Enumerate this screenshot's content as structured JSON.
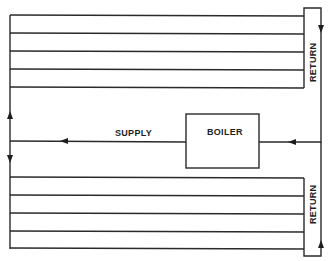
{
  "diagram": {
    "type": "two-pipe hot water heating loop (reverse return)",
    "labels": {
      "supply": "SUPPLY",
      "boiler": "BOILER",
      "return_upper": "RETURN",
      "return_lower": "RETURN"
    },
    "upper_circuit": {
      "branch_count": 5,
      "flow_direction": "up from supply, across branches, down return"
    },
    "lower_circuit": {
      "branch_count": 5,
      "flow_direction": "down from supply, across branches, up return"
    },
    "colors": {
      "line": "#2a2a2a",
      "background": "#ffffff"
    }
  }
}
